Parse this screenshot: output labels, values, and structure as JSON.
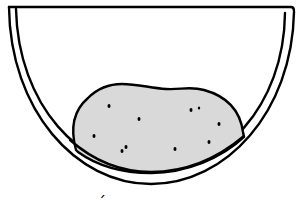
{
  "figure": {
    "bowl": {
      "label": "bowl",
      "stroke_color": "#000000",
      "fill_color": "#ffffff"
    },
    "lump": {
      "label": "lump",
      "fill_color": "#d9d9d9",
      "stroke_color": "#000000",
      "speckle_count": 11
    },
    "bottom_mark": {
      "text": "´"
    }
  }
}
